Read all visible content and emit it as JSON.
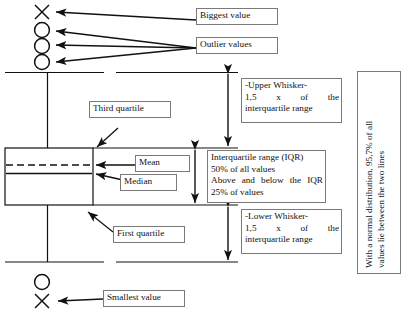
{
  "diagram": {
    "type": "box-plot-explainer"
  },
  "labels": {
    "biggest_value": "Biggest value",
    "outlier_values": "Outlier values",
    "third_quartile": "Third quartile",
    "mean": "Mean",
    "median": "Median",
    "first_quartile": "First quartile",
    "smallest_value": "Smallest value"
  },
  "upper_whisker": {
    "line1": "-Upper Whisker-",
    "line2_a": "1,5",
    "line2_b": "x",
    "line2_c": "of",
    "line2_d": "the",
    "line3": "interquartile range"
  },
  "lower_whisker": {
    "line1": "-Lower Whisker-",
    "line2_a": "1,5",
    "line2_b": "x",
    "line2_c": "of",
    "line2_d": "the",
    "line3": "interquartile range"
  },
  "iqr": {
    "line1": "Interquartile range (IQR)",
    "line2": "50% of all values",
    "line3_a": "Above",
    "line3_b": "and",
    "line3_c": "below",
    "line3_d": "the",
    "line3_e": "IQR",
    "line4": "25% of values"
  },
  "side_note": {
    "line1": "With a normal distribution, 95,7% of all",
    "line2": "values lie between the two lines"
  },
  "markers": {
    "top_x": "x-marker",
    "top_circle_1": "circle-marker",
    "top_circle_2": "circle-marker",
    "top_circle_3": "circle-marker",
    "bottom_circle": "circle-marker",
    "bottom_x": "x-marker"
  },
  "colors": {
    "ink": "#1a1a1a",
    "box_border": "#7a7a7a",
    "background": "#ffffff"
  }
}
